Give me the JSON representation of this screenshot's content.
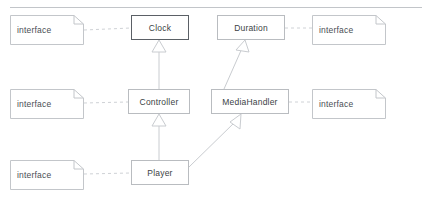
{
  "canvas": {
    "width": 422,
    "height": 204,
    "background": "#ffffff"
  },
  "divider": {
    "name": "top-divider-line",
    "x": 10,
    "y": 7,
    "width": 412,
    "color": "#c2c5c9"
  },
  "colors": {
    "node_border": "#b9bcc0",
    "node_border_selected": "#5b6066",
    "note_border": "#c3c6ca",
    "edge": "#c9ccd0",
    "dashed_edge": "#cfd2d6",
    "text": "#3b3f45"
  },
  "classes": [
    {
      "id": "clock",
      "label": "Clock",
      "x": 131,
      "y": 15,
      "width": 58,
      "height": 25,
      "selected": true
    },
    {
      "id": "duration",
      "label": "Duration",
      "x": 217,
      "y": 15,
      "width": 68,
      "height": 25,
      "selected": false
    },
    {
      "id": "controller",
      "label": "Controller",
      "x": 128,
      "y": 89,
      "width": 62,
      "height": 25,
      "selected": false
    },
    {
      "id": "mediahandler",
      "label": "MediaHandler",
      "x": 211,
      "y": 89,
      "width": 78,
      "height": 25,
      "selected": false
    },
    {
      "id": "player",
      "label": "Player",
      "x": 131,
      "y": 160,
      "width": 58,
      "height": 25,
      "selected": false
    }
  ],
  "notes": [
    {
      "id": "note-clock",
      "label": "interface",
      "x": 10,
      "y": 15,
      "width": 74,
      "height": 30
    },
    {
      "id": "note-controller",
      "label": "interface",
      "x": 10,
      "y": 89,
      "width": 74,
      "height": 30
    },
    {
      "id": "note-player",
      "label": "interface",
      "x": 10,
      "y": 160,
      "width": 74,
      "height": 30
    },
    {
      "id": "note-duration",
      "label": "interface",
      "x": 312,
      "y": 15,
      "width": 74,
      "height": 30
    },
    {
      "id": "note-mediahandler",
      "label": "interface",
      "x": 312,
      "y": 89,
      "width": 74,
      "height": 30
    }
  ],
  "edges": [
    {
      "id": "edge-controller-clock",
      "type": "generalization",
      "from": "controller",
      "to": "clock",
      "style": "solid",
      "arrow": "hollow-triangle"
    },
    {
      "id": "edge-mediahandler-duration",
      "type": "generalization",
      "from": "mediahandler",
      "to": "duration",
      "style": "solid",
      "arrow": "open-arrow"
    },
    {
      "id": "edge-player-controller",
      "type": "generalization",
      "from": "player",
      "to": "controller",
      "style": "solid",
      "arrow": "hollow-triangle"
    },
    {
      "id": "edge-player-mediahandler",
      "type": "generalization",
      "from": "player",
      "to": "mediahandler",
      "style": "solid",
      "arrow": "open-arrow"
    },
    {
      "id": "edge-note-clock",
      "type": "realization",
      "from": "note-clock",
      "to": "clock",
      "style": "dashed",
      "arrow": "none"
    },
    {
      "id": "edge-note-controller",
      "type": "realization",
      "from": "note-controller",
      "to": "controller",
      "style": "dashed",
      "arrow": "none"
    },
    {
      "id": "edge-note-player",
      "type": "realization",
      "from": "note-player",
      "to": "player",
      "style": "dashed",
      "arrow": "none"
    },
    {
      "id": "edge-duration-note",
      "type": "realization",
      "from": "duration",
      "to": "note-duration",
      "style": "dashed",
      "arrow": "none"
    },
    {
      "id": "edge-mediahandler-note",
      "type": "realization",
      "from": "mediahandler",
      "to": "note-mediahandler",
      "style": "dashed",
      "arrow": "none"
    }
  ]
}
